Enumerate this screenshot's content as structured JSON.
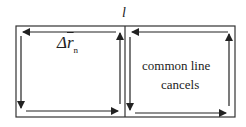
{
  "diagram": {
    "top_label": "l",
    "left_loop": {
      "delta_symbol": "Δ",
      "vector_symbol": "r",
      "subscript": "n"
    },
    "right_loop": {
      "text_line1": "common line",
      "text_line2": "cancels"
    },
    "colors": {
      "line": "#222222",
      "background": "#ffffff"
    }
  }
}
